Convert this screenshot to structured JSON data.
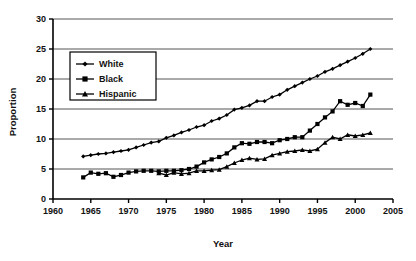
{
  "chart_data": {
    "type": "line",
    "title": "",
    "xlabel": "Year",
    "ylabel": "Proportion",
    "xlim": [
      1960,
      2005
    ],
    "ylim": [
      0,
      30
    ],
    "xticks": [
      1960,
      1965,
      1970,
      1975,
      1980,
      1985,
      1990,
      1995,
      2000,
      2005
    ],
    "yticks": [
      0,
      5,
      10,
      15,
      20,
      25,
      30
    ],
    "grid": "horizontal",
    "legend_position": "upper-left-inside",
    "series": [
      {
        "name": "White",
        "marker": "diamond",
        "color": "#000000",
        "x": [
          1964,
          1965,
          1966,
          1967,
          1968,
          1969,
          1970,
          1971,
          1972,
          1973,
          1974,
          1975,
          1976,
          1977,
          1978,
          1979,
          1980,
          1981,
          1982,
          1983,
          1984,
          1985,
          1986,
          1987,
          1988,
          1989,
          1990,
          1991,
          1992,
          1993,
          1994,
          1995,
          1996,
          1997,
          1998,
          1999,
          2000,
          2001,
          2002
        ],
        "values": [
          7.1,
          7.3,
          7.5,
          7.6,
          7.8,
          8.0,
          8.2,
          8.6,
          9.0,
          9.4,
          9.6,
          10.2,
          10.6,
          11.1,
          11.5,
          12.0,
          12.3,
          13.0,
          13.4,
          14.0,
          14.9,
          15.2,
          15.6,
          16.3,
          16.3,
          17.0,
          17.4,
          18.2,
          18.8,
          19.4,
          20.0,
          20.5,
          21.2,
          21.7,
          22.3,
          22.9,
          23.5,
          24.2,
          25.0
        ]
      },
      {
        "name": "Black",
        "marker": "square",
        "color": "#000000",
        "x": [
          1964,
          1965,
          1966,
          1967,
          1968,
          1969,
          1970,
          1971,
          1972,
          1973,
          1974,
          1975,
          1976,
          1977,
          1978,
          1979,
          1980,
          1981,
          1982,
          1983,
          1984,
          1985,
          1986,
          1987,
          1988,
          1989,
          1990,
          1991,
          1992,
          1993,
          1994,
          1995,
          1996,
          1997,
          1998,
          1999,
          2000,
          2001,
          2002
        ],
        "values": [
          3.6,
          4.4,
          4.2,
          4.3,
          3.7,
          4.0,
          4.4,
          4.6,
          4.7,
          4.7,
          4.6,
          4.7,
          4.7,
          4.8,
          5.0,
          5.4,
          6.1,
          6.6,
          7.0,
          7.6,
          8.6,
          9.3,
          9.2,
          9.5,
          9.5,
          9.3,
          9.8,
          10.0,
          10.3,
          10.3,
          11.4,
          12.5,
          13.6,
          14.6,
          16.3,
          15.7,
          16.0,
          15.5,
          17.4
        ]
      },
      {
        "name": "Hispanic",
        "marker": "triangle",
        "color": "#000000",
        "x": [
          1974,
          1975,
          1976,
          1977,
          1978,
          1979,
          1980,
          1981,
          1982,
          1983,
          1984,
          1985,
          1986,
          1987,
          1988,
          1989,
          1990,
          1991,
          1992,
          1993,
          1994,
          1995,
          1996,
          1997,
          1998,
          1999,
          2000,
          2001,
          2002
        ],
        "values": [
          4.3,
          4.0,
          4.4,
          4.2,
          4.3,
          4.7,
          4.7,
          4.8,
          4.9,
          5.4,
          6.0,
          6.5,
          6.8,
          6.6,
          6.7,
          7.3,
          7.6,
          7.9,
          8.0,
          8.2,
          8.0,
          8.3,
          9.4,
          10.3,
          10.0,
          10.7,
          10.5,
          10.7,
          11.0
        ]
      }
    ],
    "legend_entries": [
      {
        "label": "White",
        "marker": "diamond"
      },
      {
        "label": "Black",
        "marker": "square"
      },
      {
        "label": "Hispanic",
        "marker": "triangle"
      }
    ]
  }
}
